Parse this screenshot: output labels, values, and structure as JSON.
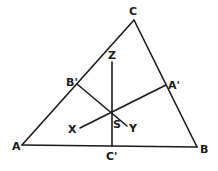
{
  "diagram": {
    "type": "geometry-triangle",
    "colors": {
      "stroke": "#1a1a1a",
      "background": "#ffffff"
    },
    "points": {
      "A": {
        "label": "A",
        "x": 22,
        "y": 145,
        "lx": 12,
        "ly": 150
      },
      "B": {
        "label": "B",
        "x": 197,
        "y": 147,
        "lx": 200,
        "ly": 153
      },
      "C": {
        "label": "C",
        "x": 134,
        "y": 20,
        "lx": 129,
        "ly": 15
      },
      "A1": {
        "label": "A'",
        "x": 166,
        "y": 85,
        "lx": 168,
        "ly": 89
      },
      "B1": {
        "label": "B'",
        "x": 77,
        "y": 84,
        "lx": 66,
        "ly": 86
      },
      "C1": {
        "label": "C'",
        "x": 112,
        "y": 146,
        "lx": 106,
        "ly": 160
      },
      "S": {
        "label": "S",
        "x": 112,
        "y": 112,
        "lx": 113,
        "ly": 128
      },
      "X": {
        "label": "X",
        "x": 80,
        "y": 128,
        "lx": 68,
        "ly": 133
      },
      "Y": {
        "label": "Y",
        "x": 127,
        "y": 126,
        "lx": 129,
        "ly": 132
      },
      "Z": {
        "label": "Z",
        "x": 112,
        "y": 62,
        "lx": 108,
        "ly": 59
      }
    },
    "segments": [
      [
        "A",
        "B"
      ],
      [
        "B",
        "C"
      ],
      [
        "C",
        "A"
      ],
      [
        "Z",
        "C1"
      ],
      [
        "B1",
        "Y"
      ],
      [
        "X",
        "A1"
      ]
    ]
  }
}
